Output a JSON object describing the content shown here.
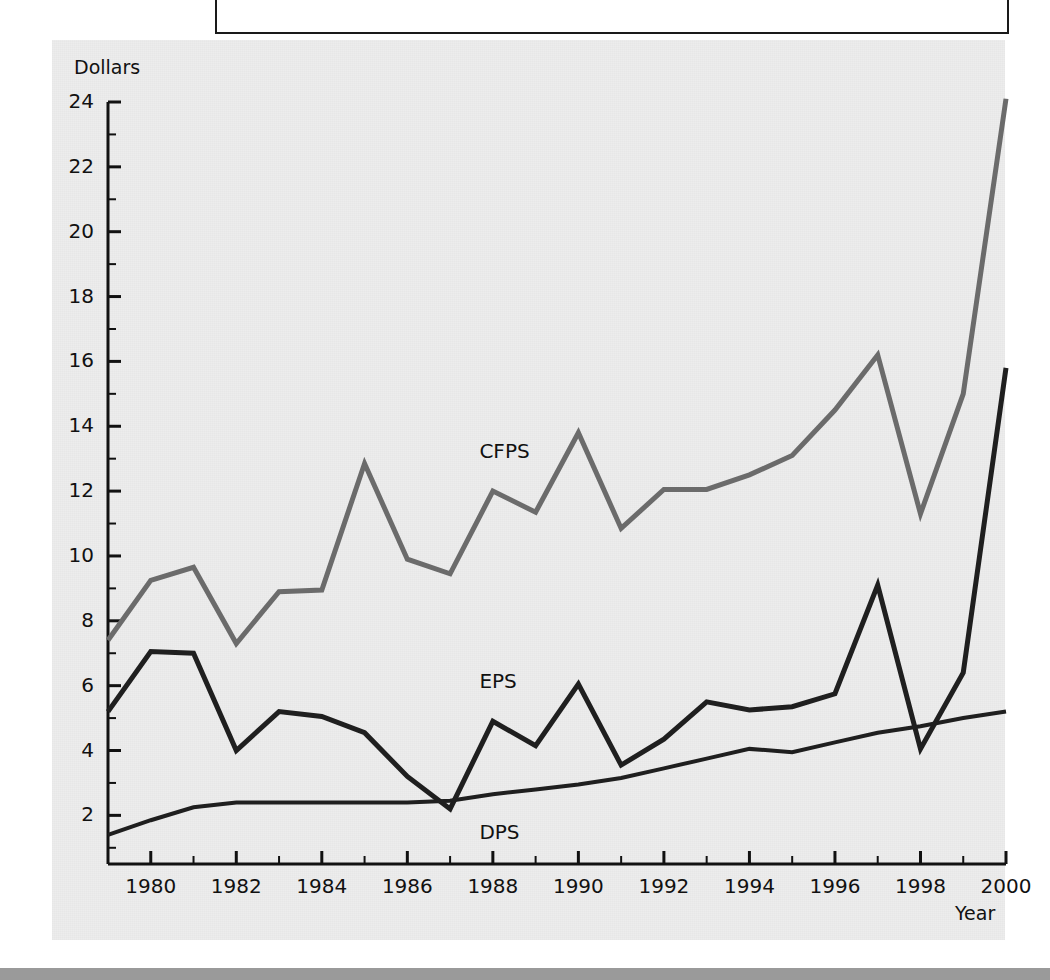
{
  "figure": {
    "background_color": "#ededed",
    "page_background": "#ffffff",
    "bottom_strip_color": "#9a9a9a"
  },
  "axes": {
    "y_title": "Dollars",
    "x_title": "Year",
    "y_ticks": [
      "24",
      "22",
      "20",
      "18",
      "16",
      "14",
      "12",
      "10",
      "8",
      "6",
      "4",
      "2"
    ],
    "x_ticks": [
      "1980",
      "1982",
      "1984",
      "1986",
      "1988",
      "1990",
      "1992",
      "1994",
      "1996",
      "1998",
      "2000"
    ]
  },
  "series_labels": {
    "cfps": "CFPS",
    "eps": "EPS",
    "dps": "DPS"
  },
  "chart_data": {
    "type": "line",
    "title": "",
    "xlabel": "Year",
    "ylabel": "Dollars",
    "xlim": [
      1979,
      2000
    ],
    "ylim": [
      0.5,
      24.5
    ],
    "ytick_values": [
      2,
      4,
      6,
      8,
      10,
      12,
      14,
      16,
      18,
      20,
      22,
      24
    ],
    "xtick_values": [
      1980,
      1982,
      1984,
      1986,
      1988,
      1990,
      1992,
      1994,
      1996,
      1998,
      2000
    ],
    "minor_ticks": true,
    "grid": false,
    "legend": "inline-labels",
    "x": [
      1979,
      1980,
      1981,
      1982,
      1983,
      1984,
      1985,
      1986,
      1987,
      1988,
      1989,
      1990,
      1991,
      1992,
      1993,
      1994,
      1995,
      1996,
      1997,
      1998,
      1999,
      2000
    ],
    "series": [
      {
        "name": "CFPS",
        "color": "#6b6b6b",
        "width": 5,
        "label_x": 1988.2,
        "label_y": 13.2,
        "values": [
          7.4,
          9.25,
          9.65,
          7.3,
          8.9,
          8.95,
          12.85,
          9.9,
          9.45,
          12.0,
          11.35,
          13.8,
          10.85,
          12.05,
          12.05,
          12.5,
          13.1,
          14.5,
          16.2,
          11.3,
          15.0,
          24.1
        ]
      },
      {
        "name": "EPS",
        "color": "#1f1f1f",
        "width": 5,
        "label_x": 1988.2,
        "label_y": 6.1,
        "values": [
          5.2,
          7.05,
          7.0,
          4.0,
          5.2,
          5.05,
          4.55,
          3.2,
          2.2,
          4.9,
          4.15,
          6.05,
          3.55,
          4.35,
          5.5,
          5.25,
          5.35,
          5.75,
          9.1,
          4.05,
          6.4,
          15.8
        ]
      },
      {
        "name": "DPS",
        "color": "#1f1f1f",
        "width": 4,
        "label_x": 1988.2,
        "label_y": 1.45,
        "values": [
          1.4,
          1.85,
          2.25,
          2.4,
          2.4,
          2.4,
          2.4,
          2.4,
          2.45,
          2.65,
          2.8,
          2.95,
          3.15,
          3.45,
          3.75,
          4.05,
          3.95,
          4.25,
          4.55,
          4.75,
          5.0,
          5.2
        ]
      }
    ]
  }
}
